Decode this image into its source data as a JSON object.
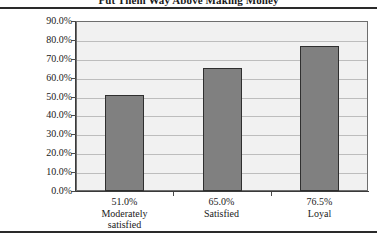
{
  "chart_data": {
    "type": "bar",
    "title": "Put Them Way Above Making Money",
    "xlabel": "",
    "ylabel": "",
    "categories": [
      "Moderately satisfied",
      "Satisfied",
      "Loyal"
    ],
    "category_lines": [
      [
        "51.0%",
        "Moderately",
        "satisfied"
      ],
      [
        "65.0%",
        "Satisfied"
      ],
      [
        "76.5%",
        "Loyal"
      ]
    ],
    "values": [
      51.0,
      65.0,
      76.5
    ],
    "value_labels": [
      "51.0%",
      "65.0%",
      "76.5%"
    ],
    "ylim": [
      0,
      90
    ],
    "ytick_labels": [
      "90.0%",
      "80.0%",
      "70.0%",
      "60.0%",
      "50.0%",
      "40.0%",
      "30.0%",
      "20.0%",
      "10.0%",
      "0.0%"
    ],
    "ytick_values": [
      90,
      80,
      70,
      60,
      50,
      40,
      30,
      20,
      10,
      0
    ],
    "grid": true,
    "legend": "none",
    "colors": {
      "bar_fill": "#808080",
      "bar_border": "#2f2f2f",
      "plot_background": "#f1f1f1",
      "gridline": "#bdbdbd",
      "axis": "#3a3a3a",
      "rule": "#2a2a2a",
      "text": "#1a1a1a"
    }
  }
}
